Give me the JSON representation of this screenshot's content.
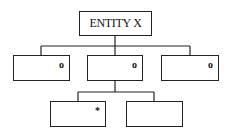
{
  "diagram": {
    "type": "jackson-structure-diagram",
    "root": {
      "label": "ENTITY X"
    },
    "level1": [
      {
        "label": "",
        "marker": "o"
      },
      {
        "label": "",
        "marker": "o"
      },
      {
        "label": "",
        "marker": "o"
      }
    ],
    "level2": [
      {
        "label": "",
        "marker": "*"
      },
      {
        "label": "",
        "marker": ""
      }
    ]
  }
}
